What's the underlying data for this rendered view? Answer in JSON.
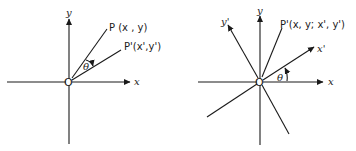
{
  "figure": {
    "left_diagram": {
      "origin_label": "O",
      "x_axis_label": "x",
      "y_axis_label": "y",
      "point_p_label": "P (x , y)",
      "point_p_prime_label": "P'(x',y')",
      "angle_label": "θ"
    },
    "right_diagram": {
      "origin_label": "O",
      "x_axis_label": "x",
      "y_axis_label": "y",
      "x_prime_axis_label": "x'",
      "y_prime_axis_label": "y'",
      "point_label": "P'(x, y; x', y')",
      "angle_label": "θ"
    },
    "colors": {
      "line": "#1a1a1a",
      "background": "#ffffff"
    }
  }
}
